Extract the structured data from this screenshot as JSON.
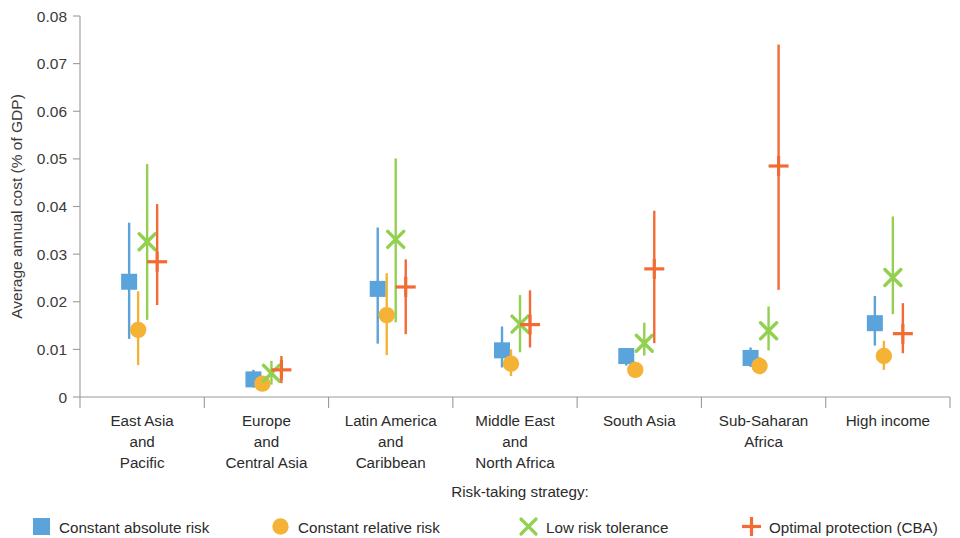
{
  "chart_data": {
    "type": "scatter",
    "title": "",
    "xlabel": "",
    "ylabel": "Average annual cost (% of GDP)",
    "ylim": [
      0,
      0.08
    ],
    "ytick_labels": [
      "0",
      "0.01",
      "0.02",
      "0.03",
      "0.04",
      "0.05",
      "0.06",
      "0.07",
      "0.08"
    ],
    "ytick_values": [
      0,
      0.01,
      0.02,
      0.03,
      0.04,
      0.05,
      0.06,
      0.07,
      0.08
    ],
    "grid": false,
    "legend_position": "bottom",
    "legend_title": "Risk-taking strategy:",
    "categories": [
      "East Asia\nand\nPacific",
      "Europe\nand\nCentral Asia",
      "Latin America\nand\nCaribbean",
      "Middle East\nand\nNorth Africa",
      "South Asia",
      "Sub-Saharan\nAfrica",
      "High income"
    ],
    "category_lines": [
      [
        "East Asia",
        "and",
        "Pacific"
      ],
      [
        "Europe",
        "and",
        "Central Asia"
      ],
      [
        "Latin America",
        "and",
        "Caribbean"
      ],
      [
        "Middle East",
        "and",
        "North Africa"
      ],
      [
        "South Asia"
      ],
      [
        "Sub-Saharan",
        "Africa"
      ],
      [
        "High income"
      ]
    ],
    "series": [
      {
        "name": "Constant absolute risk",
        "marker": "square",
        "color": "#5BA3DB",
        "values": [
          0.0242,
          0.0037,
          0.0227,
          0.0098,
          0.0086,
          0.0082,
          0.0155
        ],
        "low": [
          0.0122,
          0.002,
          0.0112,
          0.0062,
          0.0066,
          0.0063,
          0.0108
        ],
        "high": [
          0.0366,
          0.0057,
          0.0356,
          0.0148,
          0.0103,
          0.0104,
          0.0212
        ]
      },
      {
        "name": "Constant relative risk",
        "marker": "circle",
        "color": "#F5B335",
        "values": [
          0.0141,
          0.0028,
          0.0172,
          0.007,
          0.0057,
          0.0065,
          0.0086
        ],
        "low": [
          0.0067,
          0.0014,
          0.0088,
          0.0044,
          0.0043,
          0.0048,
          0.0057
        ],
        "high": [
          0.0222,
          0.0044,
          0.026,
          0.01,
          0.0074,
          0.0084,
          0.0118
        ]
      },
      {
        "name": "Low risk tolerance",
        "marker": "cross-x",
        "color": "#92D050",
        "values": [
          0.0326,
          0.005,
          0.0331,
          0.0153,
          0.0113,
          0.0139,
          0.0251
        ],
        "low": [
          0.0162,
          0.0026,
          0.0157,
          0.0094,
          0.0087,
          0.0098,
          0.0174
        ],
        "high": [
          0.0489,
          0.0076,
          0.0501,
          0.0214,
          0.0156,
          0.019,
          0.0379
        ]
      },
      {
        "name": "Optimal protection (CBA)",
        "marker": "plus",
        "color": "#F26B35",
        "values": [
          0.0284,
          0.0057,
          0.0231,
          0.0152,
          0.0269,
          0.0485,
          0.0133
        ],
        "low": [
          0.0193,
          0.0029,
          0.0132,
          0.0104,
          0.0113,
          0.0225,
          0.0092
        ],
        "high": [
          0.0405,
          0.0086,
          0.0289,
          0.0224,
          0.0391,
          0.074,
          0.0197
        ]
      }
    ]
  },
  "legend": {
    "title": "Risk-taking strategy:",
    "items": [
      {
        "label": "Constant absolute risk",
        "icon": "square-marker-icon",
        "color": "#5BA3DB"
      },
      {
        "label": "Constant relative risk",
        "icon": "circle-marker-icon",
        "color": "#F5B335"
      },
      {
        "label": "Low risk tolerance",
        "icon": "x-marker-icon",
        "color": "#92D050"
      },
      {
        "label": "Optimal protection (CBA)",
        "icon": "plus-marker-icon",
        "color": "#F26B35"
      }
    ]
  }
}
